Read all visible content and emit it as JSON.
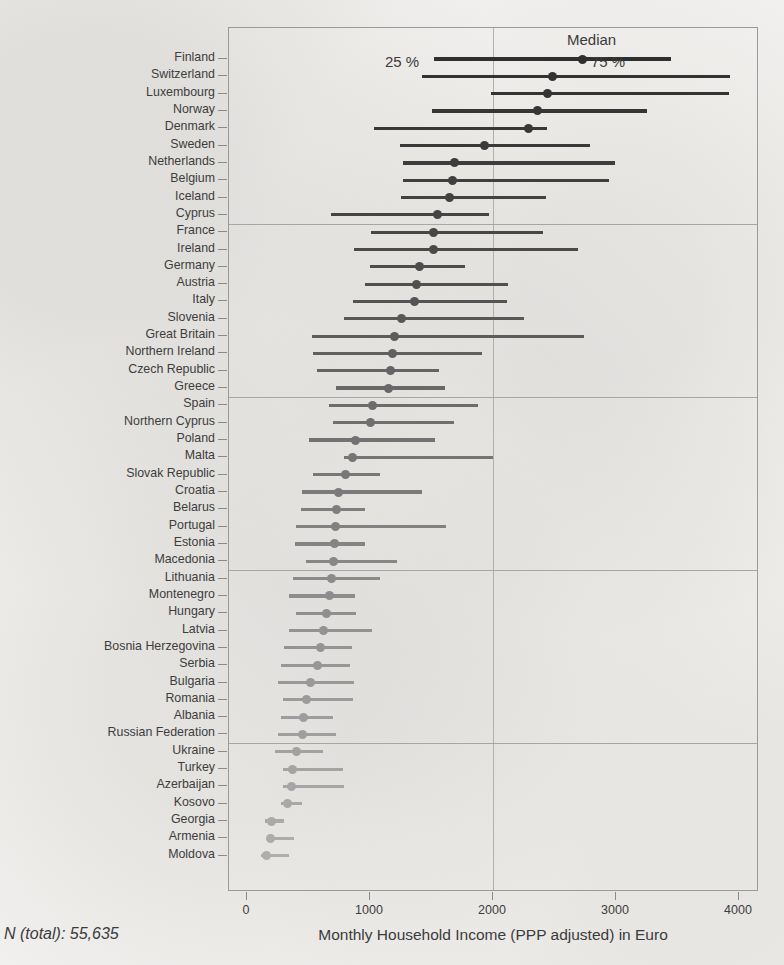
{
  "figure": {
    "n_total_label": "N (total): 55,635",
    "xaxis_title": "Monthly Household Income (PPP adjusted) in Euro",
    "legend": {
      "median": "Median",
      "lower": "25 %",
      "upper": "75 %"
    }
  },
  "chart_data": {
    "type": "bar",
    "subtype": "quantile-range-dot-plot",
    "title": "",
    "xlabel": "Monthly Household Income (PPP adjusted) in Euro",
    "ylabel": "",
    "xlim": [
      0,
      4300
    ],
    "xticks": [
      0,
      1000,
      2000,
      3000,
      4000
    ],
    "xticklabels": [
      "0",
      "1000",
      "2000",
      "3000",
      "4000"
    ],
    "grid": "single vertical gridline at 2000",
    "gridline_x": 2000,
    "legend_position": "top-inside",
    "annotations": [
      "Median",
      "25 %",
      "75 %"
    ],
    "group_separator_after_rows": [
      10,
      20,
      30,
      40
    ],
    "series": [
      {
        "name": "p25",
        "label": "25 %"
      },
      {
        "name": "median",
        "label": "Median"
      },
      {
        "name": "p75",
        "label": "75 %"
      }
    ],
    "categories": [
      "Finland",
      "Switzerland",
      "Luxembourg",
      "Norway",
      "Denmark",
      "Sweden",
      "Netherlands",
      "Belgium",
      "Iceland",
      "Cyprus",
      "France",
      "Ireland",
      "Germany",
      "Austria",
      "Italy",
      "Slovenia",
      "Great Britain",
      "Northern Ireland",
      "Czech Republic",
      "Greece",
      "Spain",
      "Northern Cyprus",
      "Poland",
      "Malta",
      "Slovak Republic",
      "Croatia",
      "Belarus",
      "Portugal",
      "Estonia",
      "Macedonia",
      "Lithuania",
      "Montenegro",
      "Hungary",
      "Latvia",
      "Bosnia Herzegovina",
      "Serbia",
      "Bulgaria",
      "Romania",
      "Albania",
      "Russian Federation",
      "Ukraine",
      "Turkey",
      "Azerbaijan",
      "Kosovo",
      "Georgia",
      "Armenia",
      "Moldova"
    ],
    "rows": [
      {
        "country": "Finland",
        "p25": 1520,
        "median": 2730,
        "p75": 3450,
        "shade": "#2f2f2f"
      },
      {
        "country": "Switzerland",
        "p25": 1420,
        "median": 2480,
        "p75": 3930,
        "shade": "#323232"
      },
      {
        "country": "Luxembourg",
        "p25": 1980,
        "median": 2440,
        "p75": 3920,
        "shade": "#343434"
      },
      {
        "country": "Norway",
        "p25": 1500,
        "median": 2360,
        "p75": 3250,
        "shade": "#363636"
      },
      {
        "country": "Denmark",
        "p25": 1030,
        "median": 2290,
        "p75": 2440,
        "shade": "#383838"
      },
      {
        "country": "Sweden",
        "p25": 1240,
        "median": 1930,
        "p75": 2790,
        "shade": "#3a3a3a"
      },
      {
        "country": "Netherlands",
        "p25": 1270,
        "median": 1690,
        "p75": 2990,
        "shade": "#3d3d3d"
      },
      {
        "country": "Belgium",
        "p25": 1270,
        "median": 1670,
        "p75": 2940,
        "shade": "#3f3f3f"
      },
      {
        "country": "Iceland",
        "p25": 1250,
        "median": 1650,
        "p75": 2430,
        "shade": "#424242"
      },
      {
        "country": "Cyprus",
        "p25": 680,
        "median": 1550,
        "p75": 1970,
        "shade": "#444444"
      },
      {
        "country": "France",
        "p25": 1010,
        "median": 1520,
        "p75": 2410,
        "shade": "#474747"
      },
      {
        "country": "Ireland",
        "p25": 870,
        "median": 1520,
        "p75": 2690,
        "shade": "#4a4a4a"
      },
      {
        "country": "Germany",
        "p25": 1000,
        "median": 1400,
        "p75": 1770,
        "shade": "#4d4d4d"
      },
      {
        "country": "Austria",
        "p25": 960,
        "median": 1380,
        "p75": 2120,
        "shade": "#505050"
      },
      {
        "country": "Italy",
        "p25": 860,
        "median": 1360,
        "p75": 2110,
        "shade": "#545454"
      },
      {
        "country": "Slovenia",
        "p25": 790,
        "median": 1260,
        "p75": 2250,
        "shade": "#585858"
      },
      {
        "country": "Great Britain",
        "p25": 530,
        "median": 1200,
        "p75": 2740,
        "shade": "#5c5c5c"
      },
      {
        "country": "Northern Ireland",
        "p25": 540,
        "median": 1180,
        "p75": 1910,
        "shade": "#606060"
      },
      {
        "country": "Czech Republic",
        "p25": 570,
        "median": 1170,
        "p75": 1560,
        "shade": "#646464"
      },
      {
        "country": "Greece",
        "p25": 720,
        "median": 1150,
        "p75": 1610,
        "shade": "#686868"
      },
      {
        "country": "Spain",
        "p25": 670,
        "median": 1020,
        "p75": 1880,
        "shade": "#6c6c6c"
      },
      {
        "country": "Northern Cyprus",
        "p25": 700,
        "median": 1000,
        "p75": 1680,
        "shade": "#6f6f6f"
      },
      {
        "country": "Poland",
        "p25": 500,
        "median": 880,
        "p75": 1530,
        "shade": "#727272"
      },
      {
        "country": "Malta",
        "p25": 790,
        "median": 860,
        "p75": 2000,
        "shade": "#757575"
      },
      {
        "country": "Slovak Republic",
        "p25": 540,
        "median": 800,
        "p75": 1080,
        "shade": "#787878"
      },
      {
        "country": "Croatia",
        "p25": 450,
        "median": 740,
        "p75": 1420,
        "shade": "#7b7b7b"
      },
      {
        "country": "Belarus",
        "p25": 440,
        "median": 730,
        "p75": 960,
        "shade": "#7e7e7e"
      },
      {
        "country": "Portugal",
        "p25": 400,
        "median": 720,
        "p75": 1620,
        "shade": "#818181"
      },
      {
        "country": "Estonia",
        "p25": 390,
        "median": 710,
        "p75": 960,
        "shade": "#848484"
      },
      {
        "country": "Macedonia",
        "p25": 480,
        "median": 700,
        "p75": 1220,
        "shade": "#878787"
      },
      {
        "country": "Lithuania",
        "p25": 370,
        "median": 690,
        "p75": 1080,
        "shade": "#8a8a8a"
      },
      {
        "country": "Montenegro",
        "p25": 340,
        "median": 670,
        "p75": 880,
        "shade": "#8d8d8d"
      },
      {
        "country": "Hungary",
        "p25": 400,
        "median": 650,
        "p75": 890,
        "shade": "#8f8f8f"
      },
      {
        "country": "Latvia",
        "p25": 340,
        "median": 620,
        "p75": 1020,
        "shade": "#929292"
      },
      {
        "country": "Bosnia Herzegovina",
        "p25": 300,
        "median": 600,
        "p75": 850,
        "shade": "#949494"
      },
      {
        "country": "Serbia",
        "p25": 280,
        "median": 570,
        "p75": 840,
        "shade": "#979797"
      },
      {
        "country": "Bulgaria",
        "p25": 250,
        "median": 520,
        "p75": 870,
        "shade": "#999999"
      },
      {
        "country": "Romania",
        "p25": 290,
        "median": 480,
        "p75": 860,
        "shade": "#9b9b9b"
      },
      {
        "country": "Albania",
        "p25": 280,
        "median": 460,
        "p75": 700,
        "shade": "#9d9d9d"
      },
      {
        "country": "Russian Federation",
        "p25": 250,
        "median": 450,
        "p75": 720,
        "shade": "#9f9f9f"
      },
      {
        "country": "Ukraine",
        "p25": 230,
        "median": 400,
        "p75": 620,
        "shade": "#a2a2a2"
      },
      {
        "country": "Turkey",
        "p25": 290,
        "median": 370,
        "p75": 780,
        "shade": "#a4a4a4"
      },
      {
        "country": "Azerbaijan",
        "p25": 290,
        "median": 360,
        "p75": 790,
        "shade": "#a6a6a6"
      },
      {
        "country": "Kosovo",
        "p25": 280,
        "median": 330,
        "p75": 450,
        "shade": "#a8a8a8"
      },
      {
        "country": "Georgia",
        "p25": 150,
        "median": 200,
        "p75": 300,
        "shade": "#aaaaaa"
      },
      {
        "country": "Armenia",
        "p25": 170,
        "median": 190,
        "p75": 380,
        "shade": "#acacac"
      },
      {
        "country": "Moldova",
        "p25": 110,
        "median": 160,
        "p75": 340,
        "shade": "#aeaeae"
      }
    ]
  }
}
